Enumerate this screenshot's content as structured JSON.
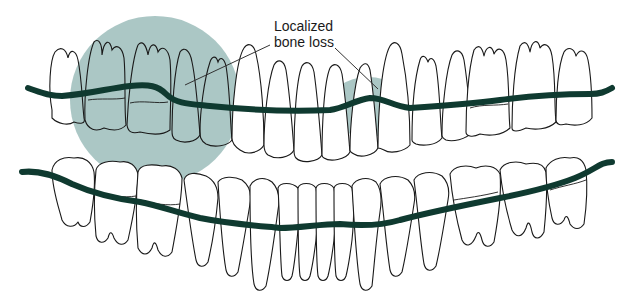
{
  "figure": {
    "type": "dental arch illustration"
  },
  "annotation": {
    "label_line1": "Localized",
    "label_line2": "bone loss",
    "pointer_count": 2
  },
  "regions": [
    {
      "name": "left-posterior-maxillary-bone-loss",
      "shape": "ellipse"
    },
    {
      "name": "anterior-maxillary-bone-loss",
      "shape": "ellipse"
    }
  ],
  "colors": {
    "bone_line": "#0f3a30",
    "bone_loss_zone": "#a7c4c2",
    "tooth_outline": "#1a1a1a",
    "background": "#ffffff"
  }
}
